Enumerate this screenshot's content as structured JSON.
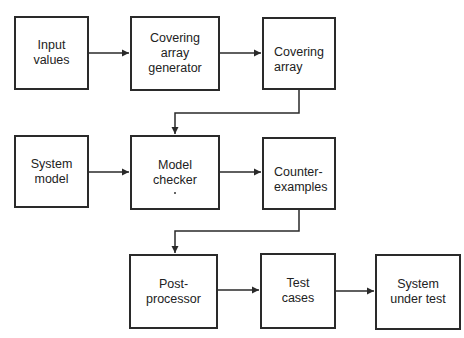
{
  "diagram": {
    "type": "flowchart",
    "nodes": [
      {
        "id": "input-values",
        "label": "Input\nvalues"
      },
      {
        "id": "covering-array-generator",
        "label": "Covering\narray\ngenerator"
      },
      {
        "id": "covering-array",
        "label": "Covering\narray"
      },
      {
        "id": "system-model",
        "label": "System\nmodel"
      },
      {
        "id": "model-checker",
        "label": "Model\nchecker"
      },
      {
        "id": "counter-examples",
        "label": "Counter-\nexamples"
      },
      {
        "id": "post-processor",
        "label": "Post-\nprocessor"
      },
      {
        "id": "test-cases",
        "label": "Test\ncases"
      },
      {
        "id": "system-under-test",
        "label": "System\nunder test"
      }
    ],
    "edges": [
      {
        "from": "input-values",
        "to": "covering-array-generator"
      },
      {
        "from": "covering-array-generator",
        "to": "covering-array"
      },
      {
        "from": "covering-array",
        "to": "model-checker"
      },
      {
        "from": "system-model",
        "to": "model-checker"
      },
      {
        "from": "model-checker",
        "to": "counter-examples"
      },
      {
        "from": "counter-examples",
        "to": "post-processor"
      },
      {
        "from": "post-processor",
        "to": "test-cases"
      },
      {
        "from": "test-cases",
        "to": "system-under-test"
      }
    ],
    "colors": {
      "stroke": "#2a2a2a",
      "background": "#ffffff"
    }
  }
}
